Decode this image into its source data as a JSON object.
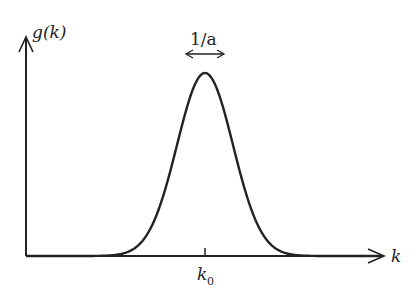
{
  "diagram": {
    "type": "gaussian-wavepacket",
    "y_axis_label": "g(k)",
    "x_axis_label": "k",
    "center_label_main": "k",
    "center_label_sub": "0",
    "width_label": "1/a",
    "colors": {
      "stroke": "#222222",
      "background": "#ffffff"
    }
  },
  "chart_data": {
    "type": "line",
    "title": "",
    "xlabel": "k",
    "ylabel": "g(k)",
    "annotations": [
      "1/a (width of peak)",
      "k0 (center of peak)"
    ],
    "grid": false,
    "center": "k0"
  }
}
